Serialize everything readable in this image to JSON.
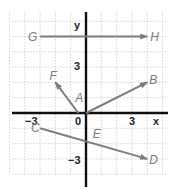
{
  "diagram": {
    "type": "coordinate-plane-vectors",
    "axes": {
      "x_label": "x",
      "y_label": "y",
      "tick_labels": {
        "x_neg": "−3",
        "origin": "0",
        "x_pos": "3",
        "y_pos": "3",
        "y_neg": "−3"
      }
    },
    "origin_px": [
      86,
      113
    ],
    "unit_px": 15.3,
    "grid_range": {
      "x": [
        -5,
        5
      ],
      "y": [
        -4,
        6
      ]
    },
    "vectors": [
      {
        "name": "GH",
        "from": "G",
        "to": "H",
        "start": [
          -3,
          5
        ],
        "end": [
          4,
          5
        ]
      },
      {
        "name": "AB",
        "from": "A",
        "to": "B",
        "start": [
          0,
          0
        ],
        "end": [
          4,
          2
        ]
      },
      {
        "name": "AF",
        "from": "A",
        "to": "F",
        "start": [
          -0.5,
          0
        ],
        "end": [
          -2,
          2
        ]
      },
      {
        "name": "CD",
        "from": "C",
        "to": "D",
        "start": [
          -3,
          -1
        ],
        "end": [
          4,
          -3
        ]
      }
    ],
    "points": [
      {
        "label": "G",
        "x": -3,
        "y": 5
      },
      {
        "label": "H",
        "x": 4,
        "y": 5
      },
      {
        "label": "F",
        "x": -2,
        "y": 2
      },
      {
        "label": "B",
        "x": 4,
        "y": 2
      },
      {
        "label": "A",
        "x": -0.5,
        "y": 0.5
      },
      {
        "label": "C",
        "x": -3,
        "y": -1
      },
      {
        "label": "D",
        "x": 4,
        "y": -3
      },
      {
        "label": "E",
        "x": 0.5,
        "y": -1
      }
    ],
    "colors": {
      "vector": "#7d7d7d",
      "axis": "#111111",
      "grid": "#c8c8c8",
      "label": "#7a7a7a"
    }
  }
}
